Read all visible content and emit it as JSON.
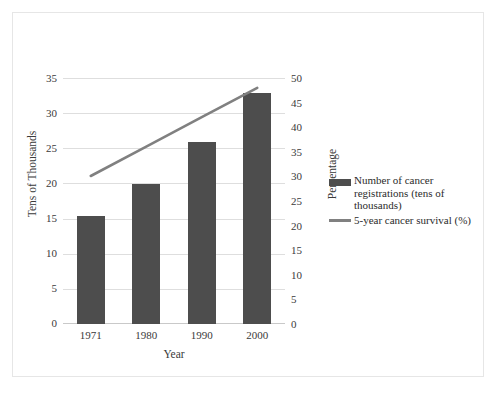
{
  "chart_data": {
    "type": "bar",
    "title": "",
    "subtitle": "",
    "xlabel": "Year",
    "ylabel": "Tens of Thousands",
    "y2label": "Percentage",
    "categories": [
      "1971",
      "1980",
      "1990",
      "2000"
    ],
    "ylim": [
      0,
      35
    ],
    "y2lim": [
      0,
      50
    ],
    "yticks": [
      "35",
      "30",
      "25",
      "20",
      "15",
      "10",
      "5",
      "0"
    ],
    "y2ticks": [
      "50",
      "45",
      "40",
      "35",
      "30",
      "25",
      "20",
      "15",
      "10",
      "5",
      "0"
    ],
    "grid": true,
    "legend_position": "right",
    "series": [
      {
        "name": "Number of cancer registrations (tens of thousands)",
        "type": "bar",
        "axis": "left",
        "color": "#4d4d4d",
        "values": [
          15.4,
          20.0,
          26.0,
          33.0
        ]
      },
      {
        "name": "5-year cancer survival (%)",
        "type": "line",
        "axis": "right",
        "color": "#808080",
        "values": [
          30,
          36,
          42,
          48
        ]
      }
    ]
  },
  "legend": {
    "entries": [
      {
        "label": "Number of cancer registrations (tens of thousands)",
        "marker": "bar-swatch-icon",
        "color": "#4d4d4d"
      },
      {
        "label": "5-year cancer survival (%)",
        "marker": "line-swatch-icon",
        "color": "#808080"
      }
    ]
  },
  "axes": {
    "x_title": "Year",
    "y_left_title": "Tens of Thousands",
    "y_right_title": "Percentage"
  }
}
